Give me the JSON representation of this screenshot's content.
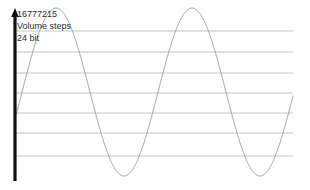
{
  "annotations": {
    "value_label": "16777215",
    "metric_label": "Volume steps",
    "bit_depth_label": "24 bit"
  },
  "colors": {
    "axis": "#111111",
    "gridline": "#b5b5b5",
    "wave": "#9a9a9a",
    "text": "#2b2b2b",
    "background": "#ffffff"
  },
  "chart_data": {
    "type": "line",
    "title": "",
    "subtitle": "",
    "xlabel": "",
    "ylabel": "",
    "grid": true,
    "legend": null,
    "annotations": [
      "16777215",
      "Volume steps",
      "24 bit"
    ],
    "axis": {
      "y_axis_visible": true,
      "y_axis_arrow": true,
      "y_axis_x": 15,
      "y_axis_top": 10,
      "y_axis_bottom": 181,
      "x_axis_visible": false
    },
    "gridlines": {
      "orientation": "horizontal",
      "count": 7,
      "y_positions": [
        31,
        52,
        73,
        93,
        113,
        133,
        156
      ],
      "x_start": 15,
      "x_end": 293
    },
    "series": [
      {
        "name": "volume waveform",
        "waveform": "sine",
        "baseline_y": 92,
        "amplitude": 84,
        "period": 136,
        "phase_x_zero_crossing": 22,
        "x_start": 16,
        "x_end": 293,
        "peaks_x": [
          88,
          224
        ],
        "peaks_y": [
          8,
          8
        ],
        "troughs_x": [
          156
        ],
        "troughs_y": [
          176
        ],
        "x": [
          16,
          22,
          40,
          55,
          70,
          88,
          105,
          120,
          135,
          152,
          156,
          170,
          190,
          210,
          224,
          240,
          260,
          280,
          293
        ],
        "y": [
          181,
          157,
          104,
          58,
          24,
          8,
          20,
          50,
          110,
          172,
          176,
          160,
          92,
          30,
          8,
          30,
          88,
          150,
          181
        ]
      }
    ]
  }
}
